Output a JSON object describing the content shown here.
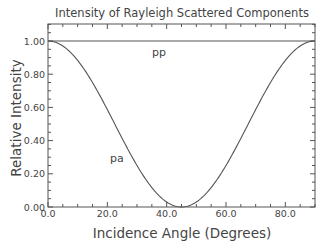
{
  "chart_data": {
    "type": "line",
    "title": "Intensity of Rayleigh Scattered Components",
    "xlabel": "Incidence Angle (Degrees)",
    "ylabel": "Relative Intensity",
    "xlim": [
      0,
      90
    ],
    "ylim": [
      0,
      1.1
    ],
    "xticks": [
      "0.0",
      "20.0",
      "40.0",
      "60.0",
      "80.0"
    ],
    "yticks": [
      "0.00",
      "0.20",
      "0.40",
      "0.60",
      "0.80",
      "1.00"
    ],
    "grid": false,
    "legend": "none",
    "series": [
      {
        "name": "pp",
        "x": [
          0,
          15,
          30,
          45,
          60,
          75,
          90
        ],
        "values": [
          1.0,
          1.0,
          1.0,
          1.0,
          1.0,
          1.0,
          1.0
        ]
      },
      {
        "name": "pa",
        "x": [
          0,
          10,
          20,
          30,
          40,
          45,
          50,
          60,
          70,
          80,
          90
        ],
        "values": [
          1.0,
          0.883,
          0.587,
          0.25,
          0.03,
          0.0,
          0.03,
          0.25,
          0.587,
          0.883,
          1.0
        ]
      }
    ],
    "annotations": [
      {
        "text": "pp",
        "x": 40,
        "y": 0.94
      },
      {
        "text": "pa",
        "x": 25,
        "y": 0.3
      }
    ]
  }
}
